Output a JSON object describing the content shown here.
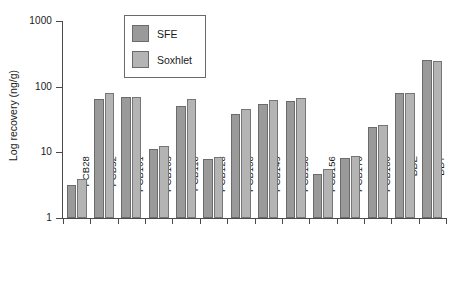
{
  "chart_data": {
    "type": "bar",
    "title": "",
    "subtitle": "",
    "xlabel": "",
    "ylabel": "Log recovery (ng/g)",
    "yscale": "log",
    "ylim": [
      1,
      1000
    ],
    "ytick_labels": [
      "1000",
      "100",
      "10",
      "1"
    ],
    "ytick_values": [
      1000,
      100,
      10,
      1
    ],
    "grid": false,
    "legend_position": "top-left-inside",
    "categories": [
      "PCB28",
      "PCB52",
      "PCB101",
      "PCB105",
      "PCB118",
      "PCB128",
      "PCB138",
      "PCB149",
      "PCB153",
      "PCB156",
      "PCB170",
      "PCB180",
      "DDE",
      "DDT"
    ],
    "series": [
      {
        "name": "SFE",
        "color": "#9a9a9a",
        "values": [
          3.2,
          66,
          69,
          11.2,
          50,
          8.0,
          38,
          55,
          60,
          4.6,
          8.2,
          24,
          79,
          253
        ]
      },
      {
        "name": "Soxhlet",
        "color": "#b4b4b4",
        "values": [
          3.9,
          81,
          69,
          12.5,
          65,
          8.6,
          45,
          63,
          68,
          5.6,
          8.8,
          26,
          81,
          245
        ]
      }
    ]
  },
  "legend": {
    "items": [
      {
        "label": "SFE",
        "swatch": "sfe"
      },
      {
        "label": "Soxhlet",
        "swatch": "sox"
      }
    ]
  },
  "axes": {
    "y_title": "Log recovery (ng/g)"
  }
}
